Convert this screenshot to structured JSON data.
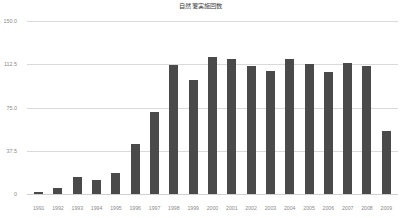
{
  "chart_data": {
    "type": "bar",
    "title": "自然薯実施回数",
    "xlabel": "",
    "ylabel": "",
    "ylim": [
      0,
      150
    ],
    "yticks": [
      "0",
      "37.5",
      "75.0",
      "112.5",
      "150.0"
    ],
    "ytick_values": [
      0,
      37.5,
      75,
      112.5,
      150
    ],
    "grid": true,
    "legend": "none",
    "bar_color": "#4a4a4a",
    "grid_color": "#d9d9d9",
    "categories": [
      "1991",
      "1992",
      "1993",
      "1994",
      "1995",
      "1996",
      "1997",
      "1998",
      "1999",
      "2000",
      "2001",
      "2002",
      "2003",
      "2004",
      "2005",
      "2006",
      "2007",
      "2008",
      "2009"
    ],
    "values": [
      2,
      5,
      15,
      12,
      18,
      43,
      71,
      112,
      99,
      119,
      117,
      111,
      107,
      117,
      113,
      106,
      114,
      111,
      55
    ]
  }
}
